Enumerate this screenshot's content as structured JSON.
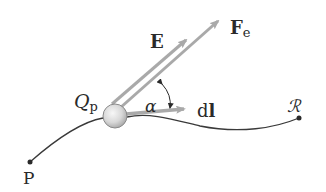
{
  "diagram": {
    "labels": {
      "charge": "Q",
      "charge_sub": "p",
      "field": "E",
      "force": "F",
      "force_sub": "e",
      "displacement": "dl",
      "displacement_d": "d",
      "displacement_l": "l",
      "angle": "α",
      "start_point": "P",
      "end_point": "ℛ"
    },
    "colors": {
      "arrow": "#a9a9a9",
      "path": "#3a3a3a",
      "text": "#2a2a2a",
      "sphere_light": "#f2f2f2",
      "sphere_dark": "#b5b5b5"
    }
  }
}
